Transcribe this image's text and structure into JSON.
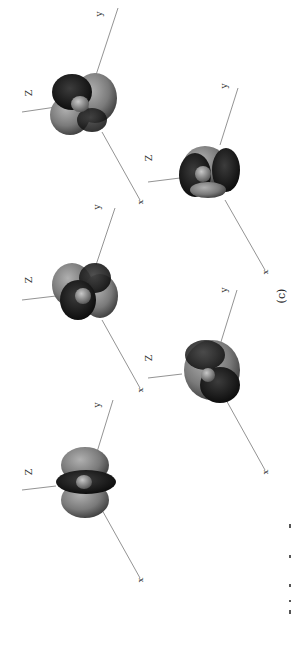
{
  "figure": {
    "label": "(c)",
    "rotation_deg": -90,
    "colors": {
      "background": "#ffffff",
      "axis": "#777777",
      "lobe_light": "#8a8a8a",
      "lobe_dark": "#1c1c1c",
      "lobe_mid": "#4a4a4a"
    },
    "panels": [
      {
        "id": "panel-1",
        "z_label": "Z",
        "y_label": "y",
        "x_label": "x"
      },
      {
        "id": "panel-2",
        "z_label": "Z",
        "y_label": "y",
        "x_label": "x"
      },
      {
        "id": "panel-3",
        "z_label": "Z",
        "y_label": "y",
        "x_label": "x"
      },
      {
        "id": "panel-4",
        "z_label": "Z",
        "y_label": "y",
        "x_label": "x"
      },
      {
        "id": "panel-5",
        "z_label": "Z",
        "y_label": "y",
        "x_label": "x"
      }
    ]
  }
}
